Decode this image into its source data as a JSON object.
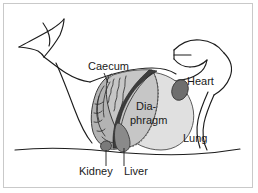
{
  "figure": {
    "background_color": "#ffffff",
    "frame_color": "#c9c9c9"
  },
  "labels": [
    {
      "id": "caecum",
      "text": "Caecum",
      "x": 88,
      "y": 70,
      "leader": true,
      "anchor": "start"
    },
    {
      "id": "heart",
      "text": "Heart",
      "x": 187,
      "y": 85,
      "leader": false,
      "anchor": "start"
    },
    {
      "id": "diaphragm_line1",
      "text": "Dia-",
      "x": 136,
      "y": 110,
      "leader": false,
      "anchor": "start"
    },
    {
      "id": "diaphragm_line2",
      "text": "phragm",
      "x": 130,
      "y": 124,
      "leader": false,
      "anchor": "start"
    },
    {
      "id": "lung",
      "text": "Lung",
      "x": 183,
      "y": 142,
      "leader": false,
      "anchor": "start"
    },
    {
      "id": "kidney",
      "text": "Kidney",
      "x": 79,
      "y": 175,
      "leader": true,
      "anchor": "start"
    },
    {
      "id": "liver",
      "text": "Liver",
      "x": 124,
      "y": 175,
      "leader": true,
      "anchor": "start"
    }
  ],
  "organs": [
    {
      "id": "caecum-mass",
      "name": "Caecum",
      "fill": "#b3b3b3"
    },
    {
      "id": "diaphragm",
      "name": "Diaphragm",
      "fill": "#c6c6c6"
    },
    {
      "id": "lung",
      "name": "Lung",
      "fill": "#e0e0e0"
    },
    {
      "id": "heart",
      "name": "Heart",
      "fill": "#6e6e6e"
    },
    {
      "id": "liver",
      "name": "Liver",
      "fill": "#8a8a8a"
    },
    {
      "id": "kidney",
      "name": "Kidney",
      "fill": "#7a7a7a"
    },
    {
      "id": "dark-band",
      "name": "Dark band",
      "fill": "#3d3d3d"
    }
  ],
  "colors": {
    "outline": "#1c1c1c",
    "text": "#1a1a1a",
    "caecum_fill": "#b3b3b3",
    "diaphragm_fill": "#c6c6c6",
    "lung_fill": "#e0e0e0",
    "heart_fill": "#6e6e6e",
    "liver_fill": "#8a8a8a",
    "kidney_fill": "#7a7a7a",
    "dark_band_fill": "#3d3d3d"
  }
}
